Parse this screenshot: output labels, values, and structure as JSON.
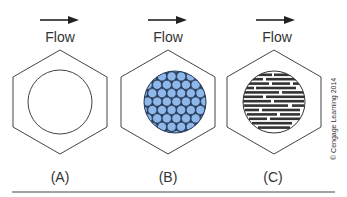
{
  "panels": [
    {
      "id": "A",
      "flow_label": "Flow",
      "caption": "(A)",
      "fill": "empty"
    },
    {
      "id": "B",
      "flow_label": "Flow",
      "caption": "(B)",
      "fill": "packed-circles"
    },
    {
      "id": "C",
      "flow_label": "Flow",
      "caption": "(C)",
      "fill": "horizontal-streaks"
    }
  ],
  "copyright": "© Cengage Learning 2014",
  "colors": {
    "stroke": "#444444",
    "cell_fill": "#8fb8ea",
    "cell_stroke": "#2a3e5c",
    "streak": "#333333"
  }
}
